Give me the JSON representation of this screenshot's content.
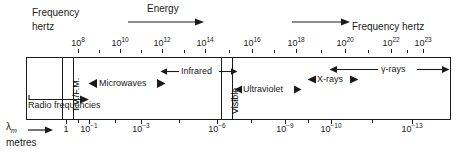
{
  "figure": {
    "type": "diagram",
    "top_axis": {
      "label_left_line1": "Frequency",
      "label_left_line2": "hertz",
      "label_right": "Frequency hertz",
      "tick_labels": [
        {
          "mantissa": "10",
          "exponent": "8",
          "x": 78
        },
        {
          "mantissa": "10",
          "exponent": "10",
          "x": 120
        },
        {
          "mantissa": "10",
          "exponent": "12",
          "x": 162
        },
        {
          "mantissa": "10",
          "exponent": "14",
          "x": 205
        },
        {
          "mantissa": "10",
          "exponent": "16",
          "x": 252
        },
        {
          "mantissa": "10",
          "exponent": "18",
          "x": 296
        },
        {
          "mantissa": "10",
          "exponent": "20",
          "x": 345
        },
        {
          "mantissa": "10",
          "exponent": "22",
          "x": 391
        },
        {
          "mantissa": "10",
          "exponent": "23",
          "x": 423
        }
      ]
    },
    "bottom_axis": {
      "label_symbol": "λ",
      "label_subscript": "m",
      "label_units": "metres",
      "tick_labels": [
        {
          "mantissa": "1",
          "exponent": "",
          "x": 66
        },
        {
          "mantissa": "10",
          "exponent": "-1",
          "x": 89
        },
        {
          "mantissa": "10",
          "exponent": "-3",
          "x": 141
        },
        {
          "mantissa": "10",
          "exponent": "-6",
          "x": 217
        },
        {
          "mantissa": "10",
          "exponent": "-9",
          "x": 285
        },
        {
          "mantissa": "10",
          "exponent": "-10",
          "x": 331
        },
        {
          "mantissa": "10",
          "exponent": "-13",
          "x": 412
        }
      ]
    },
    "arrows": {
      "energy_label": "Energy"
    },
    "bands": [
      {
        "name": "Radio frequencies",
        "style": "open-right"
      },
      {
        "name": "T.V./F.M.",
        "style": "vertical-strip"
      },
      {
        "name": "Microwaves",
        "style": "double-head"
      },
      {
        "name": "Infrared",
        "style": "double-head"
      },
      {
        "name": "Visible",
        "style": "vertical-strip"
      },
      {
        "name": "Ultraviolet",
        "style": "double-head"
      },
      {
        "name": "X-rays",
        "style": "double-head"
      },
      {
        "name": "γ-rays",
        "style": "double-head"
      }
    ],
    "colors": {
      "ink": "#1a1a1a",
      "background": "#ffffff"
    }
  }
}
